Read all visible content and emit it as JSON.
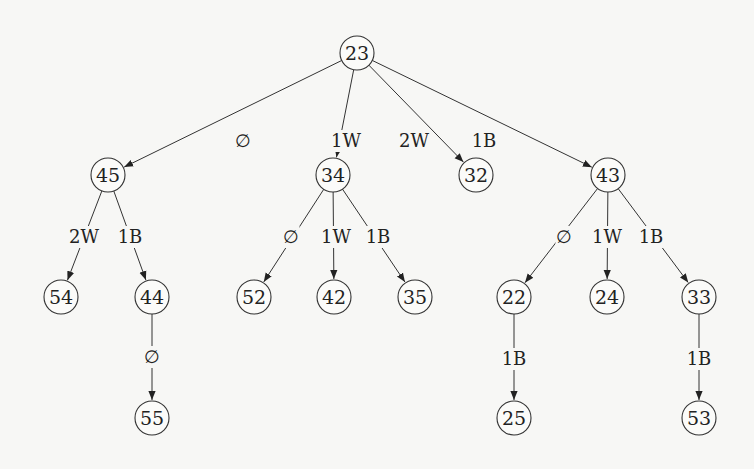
{
  "diagram": {
    "type": "tree",
    "nodes": [
      {
        "id": "23",
        "label": "23",
        "x": 357,
        "y": 53
      },
      {
        "id": "45",
        "label": "45",
        "x": 108,
        "y": 175
      },
      {
        "id": "34",
        "label": "34",
        "x": 333,
        "y": 175
      },
      {
        "id": "32",
        "label": "32",
        "x": 476,
        "y": 175
      },
      {
        "id": "43",
        "label": "43",
        "x": 608,
        "y": 175
      },
      {
        "id": "54",
        "label": "54",
        "x": 61,
        "y": 297
      },
      {
        "id": "44",
        "label": "44",
        "x": 152,
        "y": 297
      },
      {
        "id": "52",
        "label": "52",
        "x": 254,
        "y": 297
      },
      {
        "id": "42",
        "label": "42",
        "x": 334,
        "y": 297
      },
      {
        "id": "35",
        "label": "35",
        "x": 415,
        "y": 297
      },
      {
        "id": "22",
        "label": "22",
        "x": 514,
        "y": 297
      },
      {
        "id": "24",
        "label": "24",
        "x": 607,
        "y": 297
      },
      {
        "id": "33",
        "label": "33",
        "x": 699,
        "y": 297
      },
      {
        "id": "55",
        "label": "55",
        "x": 152,
        "y": 418
      },
      {
        "id": "25",
        "label": "25",
        "x": 514,
        "y": 418
      },
      {
        "id": "53",
        "label": "53",
        "x": 699,
        "y": 418
      }
    ],
    "edges": [
      {
        "from": "23",
        "to": "45",
        "label": "∅",
        "lx": 243,
        "ly": 141
      },
      {
        "from": "23",
        "to": "34",
        "label": "1W",
        "lx": 346,
        "ly": 141
      },
      {
        "from": "23",
        "to": "32",
        "label": "2W",
        "lx": 414,
        "ly": 141
      },
      {
        "from": "23",
        "to": "43",
        "label": "1B",
        "lx": 484,
        "ly": 141
      },
      {
        "from": "45",
        "to": "54",
        "label": "2W",
        "lx": 84,
        "ly": 237
      },
      {
        "from": "45",
        "to": "44",
        "label": "1B",
        "lx": 130,
        "ly": 237
      },
      {
        "from": "34",
        "to": "52",
        "label": "∅",
        "lx": 291,
        "ly": 237
      },
      {
        "from": "34",
        "to": "42",
        "label": "1W",
        "lx": 336,
        "ly": 237
      },
      {
        "from": "34",
        "to": "35",
        "label": "1B",
        "lx": 378,
        "ly": 237
      },
      {
        "from": "43",
        "to": "22",
        "label": "∅",
        "lx": 564,
        "ly": 237
      },
      {
        "from": "43",
        "to": "24",
        "label": "1W",
        "lx": 607,
        "ly": 237
      },
      {
        "from": "43",
        "to": "33",
        "label": "1B",
        "lx": 651,
        "ly": 237
      },
      {
        "from": "44",
        "to": "55",
        "label": "∅",
        "lx": 152,
        "ly": 357
      },
      {
        "from": "22",
        "to": "25",
        "label": "1B",
        "lx": 514,
        "ly": 359
      },
      {
        "from": "33",
        "to": "53",
        "label": "1B",
        "lx": 699,
        "ly": 359
      }
    ]
  }
}
